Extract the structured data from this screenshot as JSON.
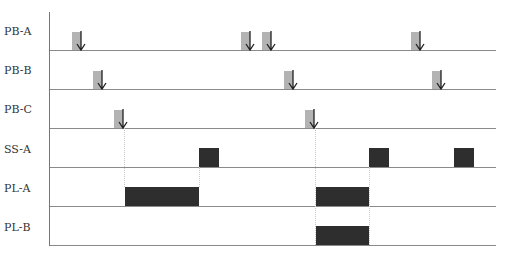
{
  "diagram": {
    "type": "timing-diagram",
    "colors": {
      "pulse": "#b3b3b3",
      "arrow": "#222222",
      "block": "#2e2e2e",
      "baseline": "#8a8a8a",
      "guide": "#c8c8c8"
    },
    "lanes": [
      {
        "label": "PB-A",
        "baseline_y": 50,
        "label_y": 24
      },
      {
        "label": "PB-B",
        "baseline_y": 89,
        "label_y": 63
      },
      {
        "label": "PB-C",
        "baseline_y": 128,
        "label_y": 102
      },
      {
        "label": "SS-A",
        "baseline_y": 167,
        "label_y": 142
      },
      {
        "label": "PL-A",
        "baseline_y": 206,
        "label_y": 181
      },
      {
        "label": "PL-B",
        "baseline_y": 245,
        "label_y": 220
      }
    ],
    "pushbutton_pulses": {
      "PB-A": [
        72,
        241,
        262,
        411
      ],
      "PB-B": [
        93,
        284,
        432
      ],
      "PB-C": [
        114,
        305
      ]
    },
    "blocks": {
      "SS-A": [
        [
          199,
          219
        ],
        [
          369,
          389
        ],
        [
          454,
          474
        ]
      ],
      "PL-A": [
        [
          124,
          199
        ],
        [
          316,
          369
        ]
      ],
      "PL-B": [
        [
          316,
          369
        ]
      ]
    },
    "guides": [
      124,
      199,
      316,
      369
    ]
  }
}
